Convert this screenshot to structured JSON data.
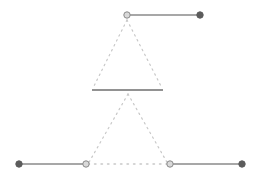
{
  "diagram": {
    "background": "#ffffff",
    "colors": {
      "solid_line": "#8a8a8a",
      "middle_line": "#6e6e6e",
      "dotted_line": "#c8c8c8",
      "filled_dot": "#5c5c5c",
      "hollow_dot_fill": "#d9d9d9",
      "hollow_dot_stroke": "#8a8a8a"
    },
    "top_segment": {
      "start": {
        "x": 127,
        "y": 15,
        "style": "hollow"
      },
      "end": {
        "x": 200,
        "y": 15,
        "style": "filled"
      }
    },
    "middle_segment": {
      "start": {
        "x": 92,
        "y": 90
      },
      "end": {
        "x": 163,
        "y": 90
      }
    },
    "bottom_left_segment": {
      "start": {
        "x": 19,
        "y": 164,
        "style": "filled"
      },
      "end": {
        "x": 86,
        "y": 164,
        "style": "hollow"
      }
    },
    "bottom_right_segment": {
      "start": {
        "x": 170,
        "y": 164,
        "style": "hollow"
      },
      "end": {
        "x": 242,
        "y": 164,
        "style": "filled"
      }
    },
    "top_triangle": {
      "apex": {
        "x": 127,
        "y": 20
      },
      "left": {
        "x": 93,
        "y": 88
      },
      "right": {
        "x": 162,
        "y": 88
      }
    },
    "bottom_triangle": {
      "apex": {
        "x": 128,
        "y": 94
      },
      "left": {
        "x": 88,
        "y": 164
      },
      "right": {
        "x": 168,
        "y": 164
      }
    }
  }
}
